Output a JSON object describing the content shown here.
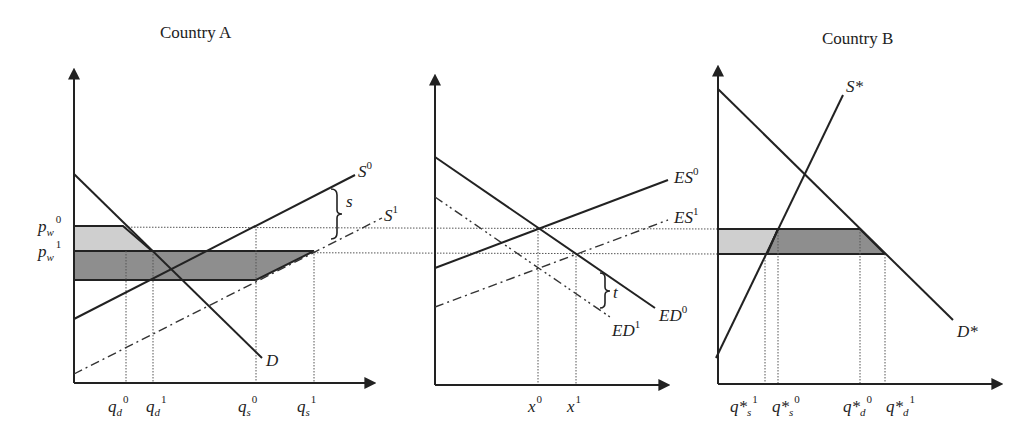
{
  "panels": {
    "country_a": {
      "title": "Country A",
      "curves": {
        "supply0": {
          "base": "S",
          "sup": "0"
        },
        "supply1": {
          "base": "S",
          "sup": "1"
        },
        "demand": {
          "base": "D"
        }
      },
      "price_labels": [
        {
          "base": "p",
          "sub": "w",
          "sup": "0"
        },
        {
          "base": "p",
          "sub": "w",
          "sup": "1"
        }
      ],
      "quantity_labels": [
        {
          "base": "q",
          "sub": "d",
          "sup": "0"
        },
        {
          "base": "q",
          "sub": "d",
          "sup": "1"
        },
        {
          "base": "q",
          "sub": "s",
          "sup": "0"
        },
        {
          "base": "q",
          "sub": "s",
          "sup": "1"
        }
      ],
      "brace_label": "s"
    },
    "world_market": {
      "curves": {
        "es0": {
          "base": "ES",
          "sup": "0"
        },
        "es1": {
          "base": "ES",
          "sup": "1"
        },
        "ed0": {
          "base": "ED",
          "sup": "0"
        },
        "ed1": {
          "base": "ED",
          "sup": "1"
        }
      },
      "quantity_labels": [
        {
          "base": "x",
          "sup": "0"
        },
        {
          "base": "x",
          "sup": "1"
        }
      ],
      "brace_label": "t"
    },
    "country_b": {
      "title": "Country B",
      "curves": {
        "supply": {
          "base": "S*"
        },
        "demand": {
          "base": "D*"
        }
      },
      "quantity_labels": [
        {
          "base": "q*",
          "sub": "s",
          "sup": "1"
        },
        {
          "base": "q*",
          "sub": "s",
          "sup": "0"
        },
        {
          "base": "q*",
          "sub": "d",
          "sup": "0"
        },
        {
          "base": "q*",
          "sub": "d",
          "sup": "1"
        }
      ]
    }
  },
  "colors": {
    "ink": "#222222",
    "light_fill": "#cfcfcf",
    "dark_fill": "#8e8e8e",
    "background": "#ffffff"
  }
}
